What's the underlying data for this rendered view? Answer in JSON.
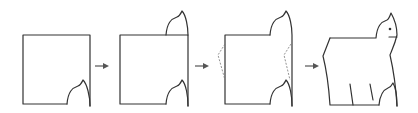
{
  "diagram": {
    "steps": [
      {
        "label": "square with cutout"
      },
      {
        "label": "cutout moved to top"
      },
      {
        "label": "side zig-zag cuts"
      },
      {
        "label": "cat figure"
      }
    ],
    "arrows": 3,
    "colors": {
      "line": "#333333",
      "dashed": "#777777",
      "arrow": "#555555",
      "background": "#ffffff"
    }
  }
}
